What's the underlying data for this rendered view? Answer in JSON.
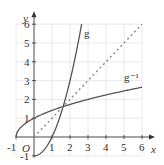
{
  "chart_data": {
    "type": "line",
    "title": "",
    "xlabel": "x",
    "ylabel": "y",
    "origin_label": "O",
    "xlim": [
      -1,
      6
    ],
    "ylim": [
      -1,
      6
    ],
    "grid": true,
    "x_ticks": [
      "-1",
      "1",
      "2",
      "3",
      "4",
      "5",
      "6"
    ],
    "y_ticks": [
      "-1",
      "1",
      "2",
      "3",
      "4",
      "5",
      "6"
    ],
    "series": [
      {
        "name": "g",
        "label": "g",
        "equation": "y = x^2 - 1, x >= 0",
        "style": "solid",
        "x": [
          0,
          0.5,
          1,
          1.5,
          1.618,
          2,
          2.5,
          2.646
        ],
        "y": [
          -1,
          -0.75,
          0,
          1.25,
          1.618,
          3,
          5.25,
          6
        ]
      },
      {
        "name": "g_inverse",
        "label": "g⁻¹",
        "equation": "y = sqrt(x + 1), x >= -1",
        "style": "solid",
        "x": [
          -1,
          -0.75,
          0,
          1,
          1.618,
          2,
          3,
          4,
          5,
          6
        ],
        "y": [
          0,
          0.5,
          1,
          1.414,
          1.618,
          1.732,
          2,
          2.236,
          2.449,
          2.646
        ]
      },
      {
        "name": "y_equals_x",
        "label": "",
        "equation": "y = x",
        "style": "dashed",
        "x": [
          0,
          6
        ],
        "y": [
          0,
          6
        ]
      }
    ],
    "annotations": [
      {
        "text": "g",
        "near": [
          2.9,
          5.5
        ]
      },
      {
        "text": "g⁻¹",
        "near": [
          5.2,
          3.2
        ]
      }
    ],
    "colors": {
      "curve": "#555555",
      "dashed": "#888888",
      "grid": "#e4e4e4",
      "axis": "#333333"
    }
  }
}
